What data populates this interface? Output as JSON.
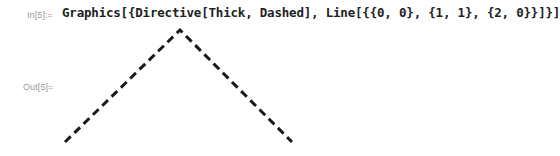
{
  "notebook": {
    "input_cell": {
      "label": "In[5]:=",
      "code": "Graphics[{Directive[Thick, Dashed], Line[{{0, 0}, {1, 1}, {2, 0}}]}]"
    },
    "output_cell": {
      "label": "Out[5]=",
      "graphic": {
        "type": "dashed-polyline",
        "stroke_color": "#1a1a1a",
        "points_data": [
          [
            0,
            0
          ],
          [
            1,
            1
          ],
          [
            2,
            0
          ]
        ],
        "svg_points": "65,142 180,30 292,142"
      }
    }
  }
}
